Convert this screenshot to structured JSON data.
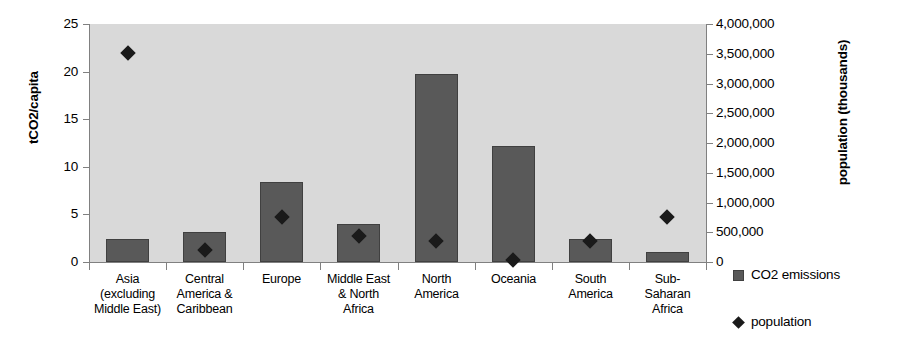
{
  "chart_data": {
    "type": "bar",
    "title": "",
    "subtitle": "",
    "xlabel": "",
    "ylabel": "tCO2/capita",
    "y2label": "population (thousands)",
    "grid": false,
    "legend_position": "right",
    "ylim": [
      0,
      25
    ],
    "y2lim": [
      0,
      4000000
    ],
    "yticks": [
      "0",
      "5",
      "10",
      "15",
      "20",
      "25"
    ],
    "ytick_values": [
      0,
      5,
      10,
      15,
      20,
      25
    ],
    "y2ticks": [
      "0",
      "500,000",
      "1,000,000",
      "1,500,000",
      "2,000,000",
      "2,500,000",
      "3,000,000",
      "3,500,000",
      "4,000,000"
    ],
    "y2tick_values": [
      0,
      500000,
      1000000,
      1500000,
      2000000,
      2500000,
      3000000,
      3500000,
      4000000
    ],
    "categories": [
      "Asia\n(excluding\nMiddle East)",
      "Central\nAmerica &\nCaribbean",
      "Europe",
      "Middle East\n& North\nAfrica",
      "North\nAmerica",
      "Oceania",
      "South\nAmerica",
      "Sub-\nSaharan\nAfrica"
    ],
    "series": [
      {
        "name": "CO2 emissions",
        "axis": "left",
        "render": "bar",
        "color": "#595959",
        "values": [
          2.4,
          3.2,
          8.4,
          4.0,
          19.7,
          12.2,
          2.4,
          1.0
        ]
      },
      {
        "name": "population",
        "axis": "right",
        "render": "marker-diamond",
        "color": "#1a1a1a",
        "values": [
          3520000,
          210000,
          750000,
          430000,
          350000,
          32000,
          360000,
          750000
        ]
      }
    ]
  },
  "axes": {
    "left": {
      "title": "tCO2/capita",
      "ticks": [
        "0",
        "5",
        "10",
        "15",
        "20",
        "25"
      ]
    },
    "right": {
      "title": "population (thousands)",
      "ticks": [
        "0",
        "500,000",
        "1,000,000",
        "1,500,000",
        "2,000,000",
        "2,500,000",
        "3,000,000",
        "3,500,000",
        "4,000,000"
      ]
    }
  },
  "legend": {
    "items": [
      {
        "label": "CO2 emissions",
        "marker": "square-icon",
        "color": "#595959"
      },
      {
        "label": "population",
        "marker": "diamond-icon",
        "color": "#1a1a1a"
      }
    ]
  },
  "colors": {
    "plot_background": "#d9d9d9",
    "bar_fill": "#595959",
    "bar_border": "#404040",
    "marker": "#1a1a1a",
    "axis_line": "#808080",
    "page_background": "#ffffff",
    "text": "#000000"
  }
}
